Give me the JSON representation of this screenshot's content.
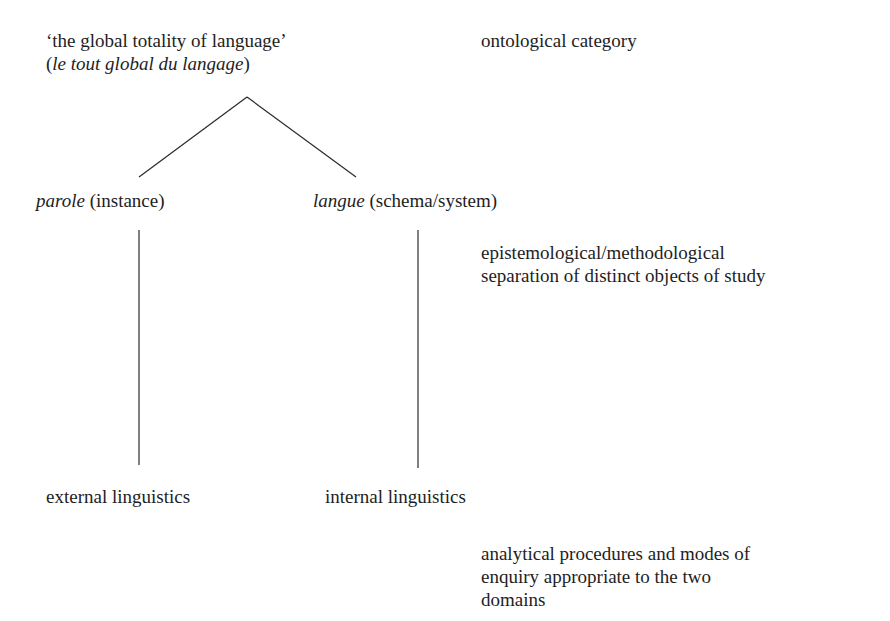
{
  "diagram": {
    "root": {
      "line1": "‘the global totality of language’",
      "line2_open": "(",
      "line2_italic": "le tout global du langage",
      "line2_close": ")"
    },
    "level1": {
      "left": {
        "term": "parole",
        "gloss": " (instance)"
      },
      "right": {
        "term": "langue",
        "gloss": " (schema/system)"
      }
    },
    "level2": {
      "left": "external linguistics",
      "right": "internal linguistics"
    },
    "annotations": {
      "top": "ontological category",
      "middle_line1": "epistemological/methodological",
      "middle_line2": "separation of distinct objects of study",
      "bottom_line1": "analytical procedures and modes of",
      "bottom_line2": "enquiry appropriate to the two",
      "bottom_line3": "domains"
    }
  }
}
